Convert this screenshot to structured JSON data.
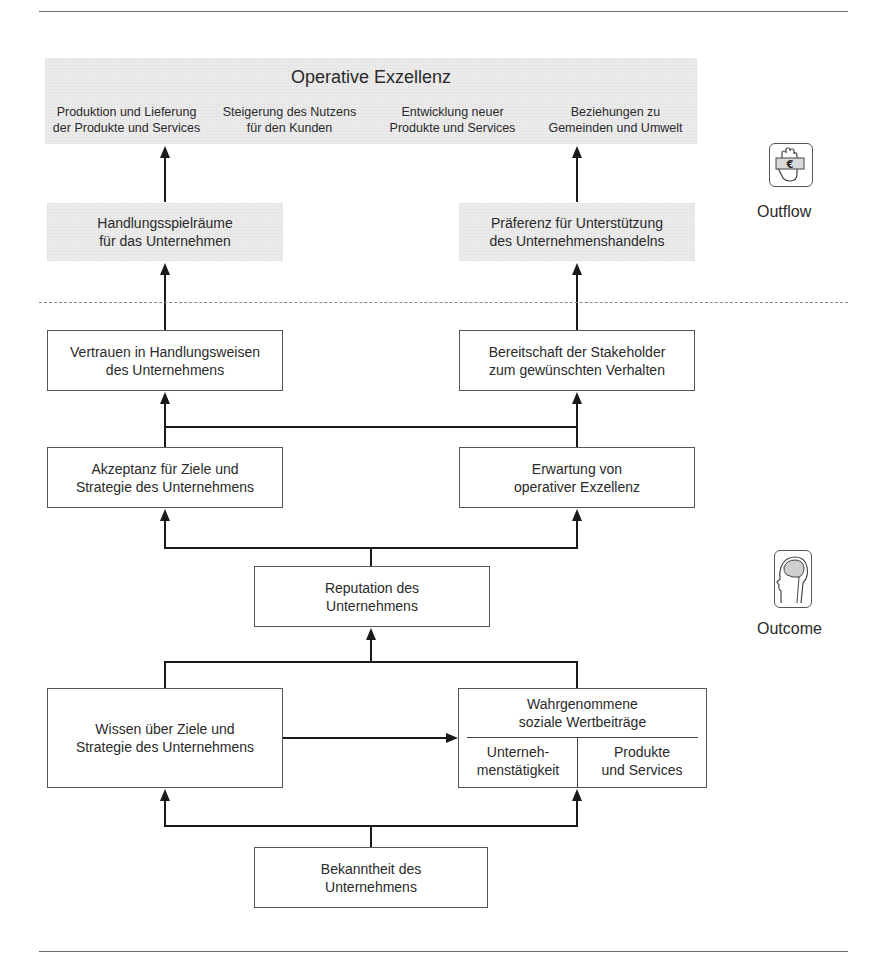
{
  "outflow_section": {
    "operative_excellence": {
      "title": "Operative Exzellenz",
      "items": [
        {
          "line1": "Produktion und Lieferung",
          "line2": "der Produkte und Services"
        },
        {
          "line1": "Steigerung des Nutzens",
          "line2": "für den Kunden"
        },
        {
          "line1": "Entwicklung neuer",
          "line2": "Produkte und Services"
        },
        {
          "line1": "Beziehungen zu",
          "line2": "Gemeinden und Umwelt"
        }
      ]
    },
    "left_box": {
      "line1": "Handlungsspielräume",
      "line2": "für das Unternehmen"
    },
    "right_box": {
      "line1": "Präferenz für Unterstützung",
      "line2": "des Unternehmenshandelns"
    },
    "label": "Outflow",
    "icon": "hand-euro-icon"
  },
  "outcome_section": {
    "trust": {
      "line1": "Vertrauen in Handlungsweisen",
      "line2": "des Unternehmens"
    },
    "readiness": {
      "line1": "Bereitschaft der Stakeholder",
      "line2": "zum gewünschten Verhalten"
    },
    "acceptance": {
      "line1": "Akzeptanz für Ziele und",
      "line2": "Strategie des Unternehmens"
    },
    "expectation": {
      "line1": "Erwartung von",
      "line2": "operativer Exzellenz"
    },
    "reputation": {
      "line1": "Reputation des",
      "line2": "Unternehmens"
    },
    "knowledge": {
      "line1": "Wissen über Ziele und",
      "line2": "Strategie des Unternehmens"
    },
    "perceived": {
      "line1": "Wahrgenommene",
      "line2": "soziale Wertbeiträge",
      "left": {
        "line1": "Unterneh-",
        "line2": "menstätigkeit"
      },
      "right": {
        "line1": "Produkte",
        "line2": "und Services"
      }
    },
    "awareness": {
      "line1": "Bekanntheit des",
      "line2": "Unternehmens"
    },
    "label": "Outcome",
    "icon": "head-brain-icon"
  }
}
